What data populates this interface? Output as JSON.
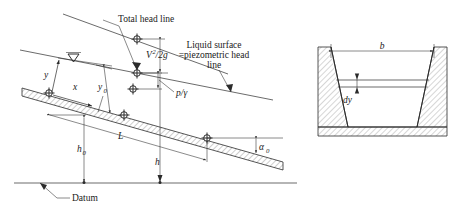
{
  "figure": {
    "title_visible": false,
    "panels": [
      {
        "name": "longitudinal-profile",
        "labels": {
          "total_head_line": "Total head line",
          "liquid_surface_line1": "Liquid surface",
          "liquid_surface_line2": "=piezometric head",
          "liquid_surface_line3": "line",
          "datum": "Datum",
          "velocity_head_num": "V",
          "velocity_head_exp": "2",
          "velocity_head_den": "/2g",
          "pressure_head": "p/γ",
          "axis_y": "y",
          "axis_x": "x",
          "depth_y0_base": "y",
          "depth_y0_sub": "0",
          "height_h0_base": "h",
          "height_h0_sub": "0",
          "length_L": "L",
          "height_h": "h",
          "angle_alpha0_base": "α",
          "angle_alpha0_sub": "0"
        }
      },
      {
        "name": "channel-cross-section",
        "labels": {
          "top_width_b": "b",
          "elemental_depth_dy": "dy"
        }
      }
    ],
    "colors": {
      "ink": "#2b2b2b",
      "hatch": "#6f6f6f",
      "background": "#ffffff"
    }
  }
}
